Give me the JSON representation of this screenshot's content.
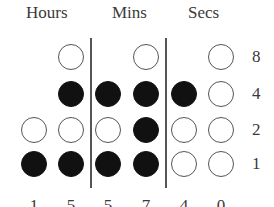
{
  "headers": {
    "hours": "Hours",
    "mins": "Mins",
    "secs": "Secs"
  },
  "bit_labels": [
    "8",
    "4",
    "2",
    "1"
  ],
  "digits": [
    "1",
    "5",
    "5",
    "7",
    "4",
    "0"
  ],
  "columns": [
    {
      "group": "hours",
      "digit": "1",
      "bits": {
        "8": null,
        "4": null,
        "2": false,
        "1": true
      }
    },
    {
      "group": "hours",
      "digit": "5",
      "bits": {
        "8": false,
        "4": true,
        "2": false,
        "1": true
      }
    },
    {
      "group": "mins",
      "digit": "5",
      "bits": {
        "8": null,
        "4": true,
        "2": false,
        "1": true
      }
    },
    {
      "group": "mins",
      "digit": "7",
      "bits": {
        "8": false,
        "4": true,
        "2": true,
        "1": true
      }
    },
    {
      "group": "secs",
      "digit": "4",
      "bits": {
        "8": null,
        "4": true,
        "2": false,
        "1": false
      }
    },
    {
      "group": "secs",
      "digit": "0",
      "bits": {
        "8": false,
        "4": false,
        "2": false,
        "1": false
      }
    }
  ],
  "time_shown": "15:57:40",
  "colors": {
    "on": "#111111",
    "off": "#ffffff",
    "stroke": "#555555"
  }
}
